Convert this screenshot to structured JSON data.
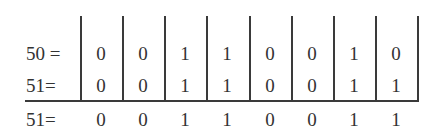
{
  "table": {
    "rows": [
      {
        "label": "50 =",
        "bits": [
          "0",
          "0",
          "1",
          "1",
          "0",
          "0",
          "1",
          "0"
        ]
      },
      {
        "label": "51=",
        "bits": [
          "0",
          "0",
          "1",
          "1",
          "0",
          "0",
          "1",
          "1"
        ]
      },
      {
        "label": "51=",
        "bits": [
          "0",
          "0",
          "1",
          "1",
          "0",
          "0",
          "1",
          "1"
        ]
      }
    ]
  }
}
